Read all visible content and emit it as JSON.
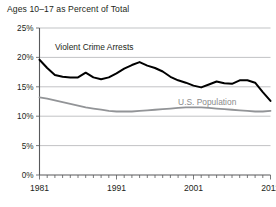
{
  "chart_data": {
    "type": "line",
    "title": "Ages 10–17 as Percent of Total",
    "xlabel": "",
    "ylabel": "",
    "xlim": [
      1981,
      2011
    ],
    "ylim": [
      0,
      25
    ],
    "grid": true,
    "legend_position": "inline-labels",
    "y_ticks": [
      0,
      5,
      10,
      15,
      20,
      25
    ],
    "y_tick_labels": [
      "0%",
      "5%",
      "10%",
      "15%",
      "20%",
      "25%"
    ],
    "x_ticks": [
      1981,
      1991,
      2001,
      2011
    ],
    "x_tick_labels": [
      "1981",
      "1991",
      "2001",
      "2011"
    ],
    "x_minor_tick_interval": 1,
    "x": [
      1981,
      1982,
      1983,
      1984,
      1985,
      1986,
      1987,
      1988,
      1989,
      1990,
      1991,
      1992,
      1993,
      1994,
      1995,
      1996,
      1997,
      1998,
      1999,
      2000,
      2001,
      2002,
      2003,
      2004,
      2005,
      2006,
      2007,
      2008,
      2009,
      2010,
      2011
    ],
    "series": [
      {
        "name": "Violent Crime Arrests",
        "color": "#000000",
        "label_x": 1983.0,
        "label_y": 21.3,
        "values": [
          19.6,
          18.2,
          17.0,
          16.7,
          16.6,
          16.6,
          17.4,
          16.6,
          16.3,
          16.6,
          17.3,
          18.1,
          18.7,
          19.2,
          18.6,
          18.2,
          17.6,
          16.7,
          16.1,
          15.7,
          15.2,
          14.9,
          15.4,
          15.9,
          15.6,
          15.5,
          16.1,
          16.1,
          15.7,
          14.1,
          12.6
        ]
      },
      {
        "name": "U.S. Population",
        "color": "#929497",
        "label_x": 1999.0,
        "label_y": 11.9,
        "values": [
          13.2,
          13.0,
          12.7,
          12.4,
          12.1,
          11.8,
          11.5,
          11.3,
          11.1,
          10.9,
          10.8,
          10.8,
          10.8,
          10.9,
          11.0,
          11.1,
          11.2,
          11.3,
          11.4,
          11.5,
          11.5,
          11.5,
          11.4,
          11.3,
          11.2,
          11.1,
          11.0,
          10.9,
          10.8,
          10.8,
          10.9
        ]
      }
    ]
  }
}
